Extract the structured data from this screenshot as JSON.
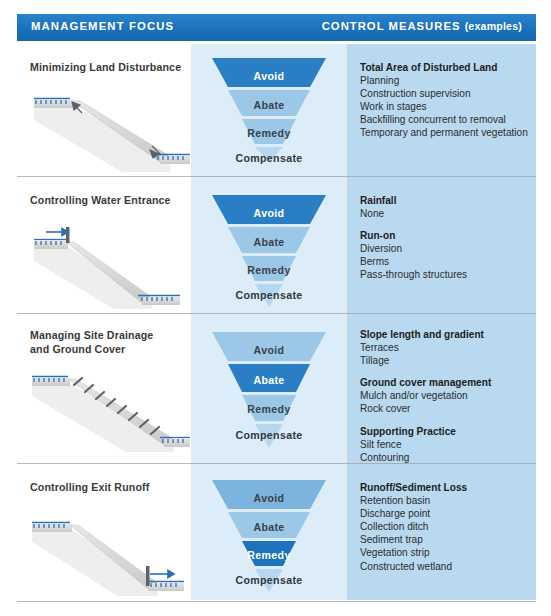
{
  "header": {
    "left_label": "MANAGEMENT FOCUS",
    "right_label": "CONTROL MEASURES",
    "right_suffix": "(examples)"
  },
  "funnel_stages": [
    "Avoid",
    "Abate",
    "Remedy",
    "Compensate"
  ],
  "colors": {
    "header_blue": "#1d77c0",
    "column_mid": "#dcecf8",
    "column_right": "#b9d9f0",
    "funnel_highlight": "#2a7fc4",
    "funnel_band_1": "#7db4dd",
    "funnel_band_2": "#9cc8e8",
    "funnel_band_3": "#b5d7ef",
    "water_blue": "#2e6fb0",
    "ground_gray": "#d4d4d4"
  },
  "rows": [
    {
      "focus": "Minimizing Land Disturbance",
      "diagram": "slope-with-cut-arrows",
      "highlight": "Avoid",
      "measures": [
        {
          "head": "Total Area of Disturbed Land",
          "items": [
            "Planning",
            "Construction supervision",
            "Work in stages",
            "Backfilling concurrent to removal",
            "Temporary and permanent vegetation"
          ]
        }
      ]
    },
    {
      "focus": "Controlling Water Entrance",
      "diagram": "slope-with-upper-barrier",
      "highlight": "Avoid",
      "measures": [
        {
          "head": "Rainfall",
          "items": [
            "None"
          ]
        },
        {
          "head": "Run-on",
          "items": [
            "Diversion",
            "Berms",
            "Pass-through structures"
          ]
        }
      ]
    },
    {
      "focus": "Managing Site Drainage\nand Ground Cover",
      "diagram": "slope-with-terrace-ticks",
      "highlight": "Abate",
      "measures": [
        {
          "head": "Slope length and gradient",
          "items": [
            "Terraces",
            "Tillage"
          ]
        },
        {
          "head": "Ground cover management",
          "items": [
            "Mulch and/or vegetation",
            "Rock cover"
          ]
        },
        {
          "head": "Supporting Practice",
          "items": [
            "Silt fence",
            "Contouring"
          ]
        }
      ]
    },
    {
      "focus": "Controlling Exit Runoff",
      "diagram": "slope-with-lower-barrier",
      "highlight": "Remedy",
      "measures": [
        {
          "head": "Runoff/Sediment Loss",
          "items": [
            "Retention basin",
            "Discharge point",
            "Collection ditch",
            "Sediment trap",
            "Vegetation strip",
            "Constructed wetland"
          ]
        }
      ]
    }
  ]
}
